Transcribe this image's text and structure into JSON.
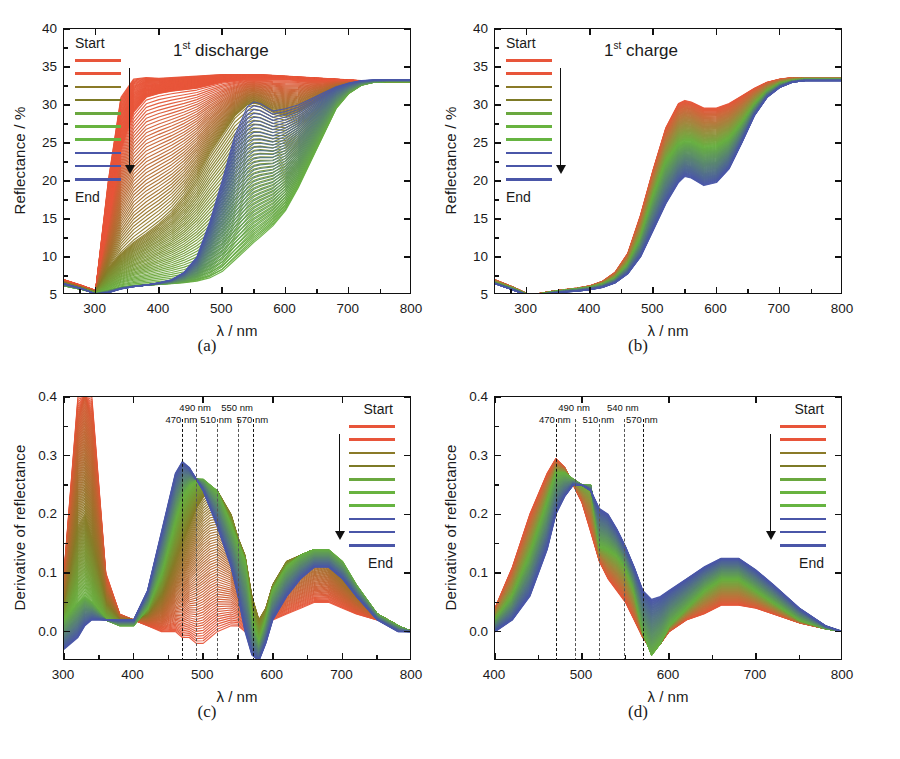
{
  "figure": {
    "panels": [
      {
        "id": "a",
        "caption": "(a)",
        "title_main": "1",
        "title_sup": "st",
        "title_rest": " discharge",
        "xlabel": "λ / nm",
        "ylabel": "Reflectance / %",
        "xticks": [
          "300",
          "400",
          "500",
          "600",
          "700",
          "800"
        ],
        "yticks": [
          "5",
          "10",
          "15",
          "20",
          "25",
          "30",
          "35",
          "40"
        ],
        "legend": {
          "start": "Start",
          "end": "End",
          "position": "inside-left"
        },
        "annotations": []
      },
      {
        "id": "b",
        "caption": "(b)",
        "title_main": "1",
        "title_sup": "st",
        "title_rest": " charge",
        "xlabel": "λ / nm",
        "ylabel": "Reflectance / %",
        "xticks": [
          "300",
          "400",
          "500",
          "600",
          "700",
          "800"
        ],
        "yticks": [
          "5",
          "10",
          "15",
          "20",
          "25",
          "30",
          "35",
          "40"
        ],
        "legend": {
          "start": "Start",
          "end": "End",
          "position": "inside-left"
        },
        "annotations": []
      },
      {
        "id": "c",
        "caption": "(c)",
        "title_main": "",
        "title_sup": "",
        "title_rest": "",
        "xlabel": "λ / nm",
        "ylabel": "Derivative of reflectance",
        "xticks": [
          "300",
          "400",
          "500",
          "600",
          "700",
          "800"
        ],
        "yticks": [
          "0.0",
          "0.1",
          "0.2",
          "0.3",
          "0.4"
        ],
        "legend": {
          "start": "Start",
          "end": "End",
          "position": "inside-right"
        },
        "annotations": [
          "470 nm",
          "490 nm",
          "510 nm",
          "550 nm",
          "570 nm"
        ]
      },
      {
        "id": "d",
        "caption": "(d)",
        "title_main": "",
        "title_sup": "",
        "title_rest": "",
        "xlabel": "λ / nm",
        "ylabel": "Derivative of reflectance",
        "xticks": [
          "400",
          "500",
          "600",
          "700",
          "800"
        ],
        "yticks": [
          "0.0",
          "0.1",
          "0.2",
          "0.3",
          "0.4"
        ],
        "legend": {
          "start": "Start",
          "end": "End",
          "position": "inside-right"
        },
        "annotations": [
          "470 nm",
          "490 nm",
          "510 nm",
          "540 nm",
          "570 nm"
        ]
      }
    ],
    "legend_colors": [
      "#e8553a",
      "#e8553a",
      "#8a7a28",
      "#7d7a26",
      "#6aa83f",
      "#68b33f",
      "#66b441",
      "#4a56a8",
      "#4a56a8",
      "#4a56a8"
    ],
    "palette": {
      "red": "#e8553a",
      "olive": "#8a7a28",
      "green": "#67b040",
      "blue": "#4a56a8",
      "axis": "#111111",
      "dash": "#555555"
    }
  },
  "chart_data": [
    {
      "type": "line",
      "panel": "a",
      "title": "1st discharge",
      "xlabel": "λ / nm",
      "ylabel": "Reflectance / %",
      "xlim": [
        250,
        800
      ],
      "ylim": [
        5,
        40
      ],
      "xticks": [
        300,
        400,
        500,
        600,
        700,
        800
      ],
      "yticks": [
        5,
        10,
        15,
        20,
        25,
        30,
        35,
        40
      ],
      "grid": false,
      "legend": [
        "Start",
        "End"
      ],
      "legend_position": "upper-left-inside",
      "series_note": "~40 spectra evolving Start(red) -> olive -> green -> blue(End)",
      "x": [
        250,
        280,
        300,
        320,
        340,
        360,
        380,
        400,
        420,
        440,
        460,
        480,
        500,
        520,
        540,
        550,
        560,
        580,
        600,
        620,
        640,
        660,
        680,
        700,
        720,
        740,
        760,
        780,
        800
      ],
      "series": [
        {
          "name": "Start (red)",
          "color": "#e8553a",
          "values": [
            7.0,
            6.2,
            5.6,
            20.0,
            31.0,
            33.4,
            33.6,
            33.5,
            33.6,
            33.7,
            33.8,
            33.9,
            34.0,
            34.0,
            34.0,
            34.0,
            34.0,
            33.9,
            33.8,
            33.7,
            33.6,
            33.5,
            33.4,
            33.3,
            33.2,
            33.1,
            33.0,
            33.0,
            33.0
          ]
        },
        {
          "name": "early-mid (red)",
          "color": "#e8553a",
          "values": [
            6.8,
            6.0,
            5.5,
            14.0,
            24.0,
            29.0,
            31.0,
            31.5,
            31.8,
            32.0,
            32.2,
            32.6,
            33.0,
            33.2,
            33.4,
            33.4,
            33.4,
            33.4,
            33.4,
            33.3,
            33.3,
            33.2,
            33.2,
            33.1,
            33.1,
            33.0,
            33.0,
            33.0,
            33.0
          ]
        },
        {
          "name": "mid (olive/brown)",
          "color": "#8a7a28",
          "values": [
            6.6,
            5.9,
            5.4,
            8.5,
            10.5,
            12.0,
            13.2,
            14.5,
            16.0,
            18.0,
            20.5,
            23.5,
            26.0,
            28.5,
            30.0,
            30.2,
            30.0,
            29.0,
            28.5,
            29.0,
            30.0,
            31.0,
            32.0,
            32.6,
            33.0,
            33.1,
            33.1,
            33.0,
            33.0
          ]
        },
        {
          "name": "late (green)",
          "color": "#67b040",
          "values": [
            6.2,
            5.7,
            5.2,
            5.6,
            6.0,
            6.2,
            6.3,
            6.4,
            6.5,
            6.6,
            6.8,
            7.2,
            8.0,
            9.5,
            11.0,
            11.8,
            12.5,
            14.0,
            16.0,
            19.0,
            22.5,
            26.0,
            29.5,
            31.5,
            32.6,
            33.0,
            33.1,
            33.1,
            33.1
          ]
        },
        {
          "name": "End (blue)",
          "color": "#4a56a8",
          "values": [
            6.5,
            5.8,
            5.1,
            5.3,
            5.8,
            6.1,
            6.3,
            6.6,
            7.0,
            8.0,
            10.0,
            14.5,
            20.0,
            26.0,
            29.8,
            30.4,
            30.2,
            29.2,
            29.5,
            30.0,
            30.8,
            31.6,
            32.4,
            32.9,
            33.2,
            33.3,
            33.3,
            33.3,
            33.3
          ]
        }
      ]
    },
    {
      "type": "line",
      "panel": "b",
      "title": "1st charge",
      "xlabel": "λ / nm",
      "ylabel": "Reflectance / %",
      "xlim": [
        250,
        800
      ],
      "ylim": [
        5,
        40
      ],
      "xticks": [
        300,
        400,
        500,
        600,
        700,
        800
      ],
      "yticks": [
        5,
        10,
        15,
        20,
        25,
        30,
        35,
        40
      ],
      "grid": false,
      "legend": [
        "Start",
        "End"
      ],
      "legend_position": "upper-left-inside",
      "series_note": "~40 spectra evolving Start(red) -> green -> blue(End)",
      "x": [
        250,
        280,
        300,
        320,
        340,
        360,
        380,
        400,
        420,
        440,
        460,
        480,
        500,
        520,
        540,
        550,
        560,
        580,
        600,
        620,
        640,
        660,
        680,
        700,
        720,
        740,
        760,
        780,
        800
      ],
      "series": [
        {
          "name": "Start (red)",
          "color": "#e8553a",
          "values": [
            7.0,
            6.0,
            5.2,
            5.2,
            5.5,
            5.7,
            5.9,
            6.2,
            6.8,
            8.0,
            10.5,
            15.5,
            21.5,
            27.0,
            30.2,
            30.6,
            30.4,
            29.6,
            29.6,
            30.2,
            31.2,
            32.2,
            33.0,
            33.4,
            33.6,
            33.6,
            33.6,
            33.6,
            33.6
          ]
        },
        {
          "name": "mid (green)",
          "color": "#67b040",
          "values": [
            6.6,
            5.8,
            5.1,
            5.1,
            5.4,
            5.6,
            5.8,
            6.0,
            6.4,
            7.2,
            9.0,
            12.5,
            18.0,
            22.5,
            24.8,
            25.2,
            25.2,
            24.4,
            24.6,
            25.6,
            27.6,
            30.0,
            31.8,
            32.8,
            33.2,
            33.4,
            33.4,
            33.4,
            33.4
          ]
        },
        {
          "name": "End (blue)",
          "color": "#4a56a8",
          "values": [
            6.5,
            5.6,
            5.0,
            5.0,
            5.2,
            5.4,
            5.5,
            5.7,
            6.0,
            6.6,
            7.8,
            10.0,
            13.5,
            17.0,
            19.8,
            20.6,
            20.4,
            19.4,
            19.8,
            21.6,
            25.0,
            28.6,
            31.0,
            32.3,
            33.0,
            33.2,
            33.2,
            33.2,
            33.2
          ]
        }
      ]
    },
    {
      "type": "line",
      "panel": "c",
      "title": "",
      "xlabel": "λ / nm",
      "ylabel": "Derivative of reflectance",
      "xlim": [
        300,
        800
      ],
      "ylim": [
        -0.05,
        0.4
      ],
      "xticks": [
        300,
        400,
        500,
        600,
        700,
        800
      ],
      "yticks": [
        0.0,
        0.1,
        0.2,
        0.3,
        0.4
      ],
      "grid": false,
      "legend": [
        "Start",
        "End"
      ],
      "legend_position": "right-inside",
      "annotations": [
        {
          "label": "470 nm",
          "x": 470
        },
        {
          "label": "490 nm",
          "x": 490
        },
        {
          "label": "510 nm",
          "x": 520
        },
        {
          "label": "550 nm",
          "x": 550
        },
        {
          "label": "570 nm",
          "x": 572
        }
      ],
      "x": [
        300,
        320,
        330,
        340,
        360,
        380,
        400,
        420,
        440,
        460,
        470,
        480,
        490,
        500,
        510,
        520,
        540,
        550,
        560,
        570,
        580,
        590,
        600,
        620,
        640,
        660,
        680,
        700,
        720,
        750,
        780,
        800
      ],
      "series": [
        {
          "name": "Start (red)",
          "color": "#e8553a",
          "values": [
            0.1,
            0.4,
            0.45,
            0.4,
            0.1,
            0.03,
            0.02,
            0.01,
            0.0,
            0.0,
            -0.01,
            -0.01,
            -0.02,
            -0.02,
            -0.01,
            0.0,
            0.01,
            0.01,
            0.0,
            0.0,
            0.0,
            0.01,
            0.02,
            0.03,
            0.04,
            0.05,
            0.05,
            0.04,
            0.03,
            0.02,
            0.01,
            0.0
          ]
        },
        {
          "name": "mid (olive)",
          "color": "#8a7a28",
          "values": [
            0.04,
            0.18,
            0.2,
            0.16,
            0.05,
            0.02,
            0.02,
            0.03,
            0.06,
            0.12,
            0.15,
            0.18,
            0.21,
            0.23,
            0.24,
            0.24,
            0.2,
            0.16,
            0.13,
            0.06,
            0.02,
            0.04,
            0.08,
            0.12,
            0.13,
            0.14,
            0.13,
            0.1,
            0.07,
            0.03,
            0.01,
            0.0
          ]
        },
        {
          "name": "late (green)",
          "color": "#67b040",
          "values": [
            0.02,
            0.05,
            0.06,
            0.05,
            0.02,
            0.01,
            0.01,
            0.04,
            0.1,
            0.19,
            0.23,
            0.25,
            0.26,
            0.26,
            0.25,
            0.24,
            0.18,
            0.15,
            0.12,
            0.02,
            -0.02,
            0.02,
            0.07,
            0.11,
            0.13,
            0.14,
            0.14,
            0.12,
            0.08,
            0.03,
            0.01,
            0.0
          ]
        },
        {
          "name": "End (blue)",
          "color": "#4a56a8",
          "values": [
            -0.03,
            -0.01,
            0.01,
            0.02,
            0.02,
            0.02,
            0.02,
            0.07,
            0.17,
            0.27,
            0.29,
            0.28,
            0.26,
            0.24,
            0.21,
            0.18,
            0.11,
            0.06,
            0.0,
            -0.04,
            -0.05,
            -0.02,
            0.02,
            0.06,
            0.09,
            0.11,
            0.11,
            0.09,
            0.06,
            0.02,
            0.0,
            0.0
          ]
        }
      ]
    },
    {
      "type": "line",
      "panel": "d",
      "title": "",
      "xlabel": "λ / nm",
      "ylabel": "Derivative of reflectance",
      "xlim": [
        400,
        800
      ],
      "ylim": [
        -0.05,
        0.4
      ],
      "xticks": [
        400,
        500,
        600,
        700,
        800
      ],
      "yticks": [
        0.0,
        0.1,
        0.2,
        0.3,
        0.4
      ],
      "grid": false,
      "legend": [
        "Start",
        "End"
      ],
      "legend_position": "right-inside",
      "annotations": [
        {
          "label": "470 nm",
          "x": 470
        },
        {
          "label": "490 nm",
          "x": 492
        },
        {
          "label": "510 nm",
          "x": 520
        },
        {
          "label": "540 nm",
          "x": 548
        },
        {
          "label": "570 nm",
          "x": 570
        }
      ],
      "x": [
        400,
        420,
        440,
        460,
        470,
        480,
        490,
        500,
        510,
        520,
        530,
        540,
        550,
        560,
        570,
        580,
        590,
        600,
        620,
        640,
        660,
        680,
        700,
        720,
        750,
        780,
        800
      ],
      "series": [
        {
          "name": "Start (red)",
          "color": "#e8553a",
          "values": [
            0.04,
            0.11,
            0.2,
            0.27,
            0.295,
            0.28,
            0.25,
            0.22,
            0.17,
            0.12,
            0.09,
            0.07,
            0.05,
            0.02,
            -0.01,
            -0.03,
            -0.02,
            0.0,
            0.02,
            0.03,
            0.045,
            0.045,
            0.04,
            0.03,
            0.015,
            0.005,
            0.0
          ]
        },
        {
          "name": "mid (green)",
          "color": "#67b040",
          "values": [
            0.02,
            0.06,
            0.13,
            0.22,
            0.27,
            0.27,
            0.26,
            0.25,
            0.25,
            0.145,
            0.14,
            0.13,
            0.11,
            0.07,
            0.0,
            -0.04,
            -0.02,
            0.01,
            0.04,
            0.07,
            0.09,
            0.09,
            0.07,
            0.05,
            0.02,
            0.005,
            0.0
          ]
        },
        {
          "name": "End (blue)",
          "color": "#4a56a8",
          "values": [
            0.0,
            0.02,
            0.06,
            0.14,
            0.2,
            0.23,
            0.25,
            0.25,
            0.24,
            0.21,
            0.2,
            0.175,
            0.145,
            0.11,
            0.07,
            0.055,
            0.06,
            0.07,
            0.09,
            0.11,
            0.125,
            0.125,
            0.105,
            0.08,
            0.04,
            0.01,
            0.0
          ]
        }
      ]
    }
  ]
}
